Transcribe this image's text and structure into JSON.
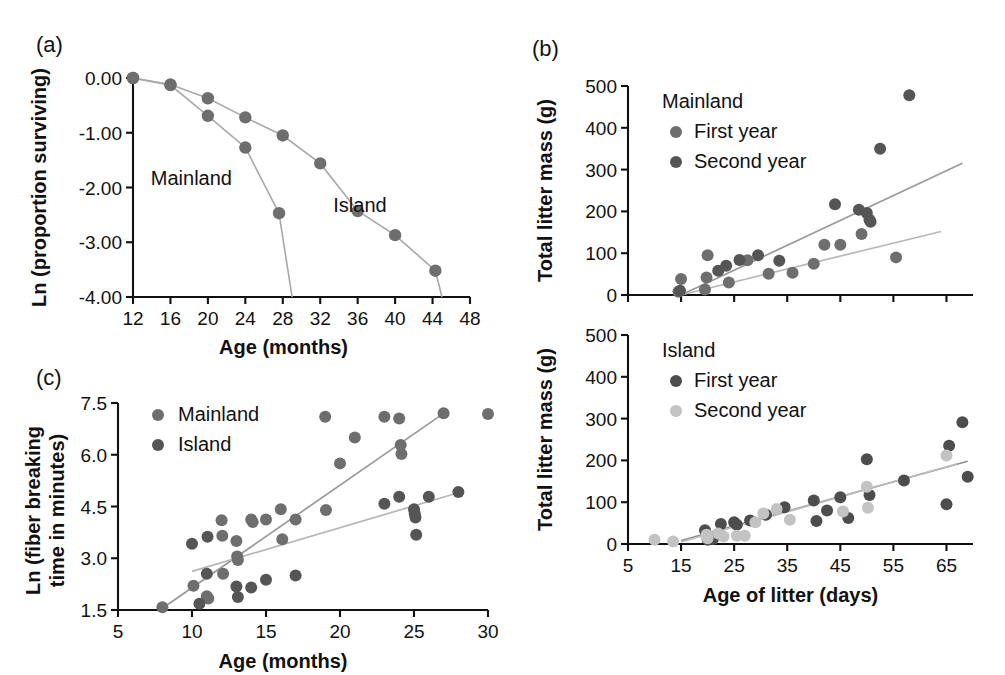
{
  "figure": {
    "background": "#ffffff",
    "ink": "#111111"
  },
  "colors": {
    "dark_gray": "#4d4d4d",
    "mid_gray": "#6e6e6e",
    "light_gray": "#bcbcbc",
    "line_gray": "#9a9a9a",
    "axis": "#111111"
  },
  "panels": {
    "a": {
      "label": "(a)",
      "annotations": [
        {
          "text": "Mainland",
          "x": 13.9,
          "y": -1.95
        },
        {
          "text": "Island",
          "x": 33.4,
          "y": -2.45
        }
      ]
    },
    "b_top": {
      "label": "(b)",
      "legend_title": "Mainland",
      "legend": [
        {
          "label": "First year",
          "color": "#6e6e6e"
        },
        {
          "label": "Second year",
          "color": "#555555"
        }
      ]
    },
    "b_bottom": {
      "legend_title": "Island",
      "legend": [
        {
          "label": "First year",
          "color": "#4d4d4d"
        },
        {
          "label": "Second year",
          "color": "#c3c3c3"
        }
      ]
    },
    "c": {
      "label": "(c)",
      "legend": [
        {
          "label": "Mainland",
          "color": "#6e6e6e"
        },
        {
          "label": "Island",
          "color": "#555555"
        }
      ]
    }
  },
  "chart_data": [
    {
      "id": "panel-a",
      "type": "line",
      "title": "",
      "xlabel": "Age (months)",
      "ylabel": "Ln (proportion surviving)",
      "xlim": [
        12,
        48
      ],
      "ylim": [
        -4.0,
        0.0
      ],
      "xticks": [
        12,
        16,
        20,
        24,
        28,
        32,
        36,
        40,
        44,
        48
      ],
      "yticks": [
        0.0,
        -1.0,
        -2.0,
        -3.0,
        -4.0
      ],
      "ytick_labels": [
        "0.00",
        "-1.00",
        "-2.00",
        "-3.00",
        "-4.00"
      ],
      "grid": false,
      "legend_position": "inline-annotation",
      "series": [
        {
          "name": "Mainland",
          "color": "#6e6e6e",
          "x": [
            12,
            16,
            20,
            24,
            27.6,
            29
          ],
          "y": [
            0.0,
            -0.13,
            -0.69,
            -1.27,
            -2.47,
            -4.0
          ]
        },
        {
          "name": "Island",
          "color": "#6e6e6e",
          "x": [
            12,
            16,
            20,
            24,
            28,
            32,
            36,
            40,
            44.3,
            45
          ],
          "y": [
            0.0,
            -0.12,
            -0.37,
            -0.72,
            -1.05,
            -1.56,
            -2.43,
            -2.87,
            -3.52,
            -4.0
          ]
        }
      ]
    },
    {
      "id": "panel-b-top",
      "type": "scatter",
      "title": "Mainland",
      "xlabel": "",
      "ylabel": "Total litter mass (g)",
      "xlim": [
        5,
        70
      ],
      "ylim": [
        0,
        500
      ],
      "xticks": [
        5,
        15,
        25,
        35,
        45,
        55,
        65
      ],
      "yticks": [
        0,
        100,
        200,
        300,
        400,
        500
      ],
      "grid": false,
      "legend_position": "upper-left-inside",
      "series": [
        {
          "name": "First year",
          "color": "#6e6e6e",
          "points": [
            [
              14.5,
              8
            ],
            [
              15.0,
              38
            ],
            [
              19.5,
              13
            ],
            [
              19.8,
              42
            ],
            [
              20.0,
              95
            ],
            [
              24.0,
              30
            ],
            [
              27.5,
              83
            ],
            [
              31.5,
              51
            ],
            [
              36.0,
              53
            ],
            [
              40.0,
              75
            ],
            [
              45.0,
              120
            ],
            [
              49.0,
              146
            ],
            [
              55.5,
              90
            ],
            [
              42.0,
              120
            ]
          ]
        },
        {
          "name": "Second year",
          "color": "#555555",
          "points": [
            [
              14.8,
              10
            ],
            [
              22.0,
              58
            ],
            [
              23.5,
              70
            ],
            [
              26.0,
              84
            ],
            [
              29.5,
              95
            ],
            [
              33.5,
              82
            ],
            [
              44.0,
              217
            ],
            [
              48.5,
              204
            ],
            [
              50.0,
              196
            ],
            [
              50.5,
              180
            ],
            [
              50.7,
              175
            ],
            [
              52.5,
              350
            ],
            [
              58.0,
              478
            ]
          ]
        }
      ],
      "trendlines": [
        {
          "name": "Second year fit",
          "color": "#9a9a9a",
          "x": [
            15.0,
            68.0
          ],
          "y": [
            0,
            315
          ]
        },
        {
          "name": "First year fit",
          "color": "#b8b8b8",
          "x": [
            15.0,
            64.0
          ],
          "y": [
            0,
            152
          ]
        }
      ]
    },
    {
      "id": "panel-b-bottom",
      "type": "scatter",
      "title": "Island",
      "xlabel": "Age of litter (days)",
      "ylabel": "Total litter mass (g)",
      "xlim": [
        5,
        70
      ],
      "ylim": [
        0,
        500
      ],
      "xticks": [
        5,
        15,
        25,
        35,
        45,
        55,
        65
      ],
      "yticks": [
        0,
        100,
        200,
        300,
        400,
        500
      ],
      "grid": false,
      "legend_position": "upper-left-inside",
      "series": [
        {
          "name": "First year",
          "color": "#4d4d4d",
          "points": [
            [
              19.5,
              33
            ],
            [
              20.0,
              10
            ],
            [
              21.0,
              12
            ],
            [
              22.5,
              48
            ],
            [
              25.0,
              52
            ],
            [
              25.5,
              46
            ],
            [
              28.0,
              56
            ],
            [
              31.0,
              70
            ],
            [
              34.5,
              88
            ],
            [
              40.0,
              104
            ],
            [
              40.5,
              55
            ],
            [
              42.5,
              80
            ],
            [
              45.0,
              112
            ],
            [
              46.5,
              62
            ],
            [
              50.0,
              203
            ],
            [
              50.5,
              117
            ],
            [
              57.0,
              152
            ],
            [
              65.0,
              95
            ],
            [
              65.5,
              235
            ],
            [
              68.0,
              291
            ],
            [
              69.0,
              161
            ]
          ]
        },
        {
          "name": "Second year",
          "color": "#c3c3c3",
          "points": [
            [
              10.0,
              10
            ],
            [
              13.5,
              6
            ],
            [
              19.8,
              22
            ],
            [
              20.0,
              14
            ],
            [
              22.0,
              25
            ],
            [
              23.0,
              18
            ],
            [
              25.5,
              20
            ],
            [
              27.0,
              20
            ],
            [
              29.0,
              52
            ],
            [
              30.5,
              73
            ],
            [
              33.0,
              84
            ],
            [
              35.5,
              58
            ],
            [
              45.5,
              78
            ],
            [
              50.0,
              137
            ],
            [
              50.2,
              87
            ],
            [
              65.0,
              212
            ]
          ]
        }
      ],
      "trendlines": [
        {
          "name": "First year fit",
          "color": "#8d8d8d",
          "x": [
            15.0,
            69.0
          ],
          "y": [
            8,
            198
          ]
        },
        {
          "name": "Second year fit",
          "color": "#bdbdbd",
          "x": [
            15.0,
            67.0
          ],
          "y": [
            5,
            192
          ]
        }
      ]
    },
    {
      "id": "panel-c",
      "type": "scatter",
      "title": "",
      "xlabel": "Age (months)",
      "ylabel": "Ln (fiber breaking time in minutes)",
      "xlim": [
        5,
        30
      ],
      "ylim": [
        1.5,
        7.5
      ],
      "xticks": [
        5,
        10,
        15,
        20,
        25,
        30
      ],
      "yticks": [
        1.5,
        3.0,
        4.5,
        6.0,
        7.5
      ],
      "ytick_labels": [
        "1.5",
        "3.0",
        "4.5",
        "6.0",
        "7.5"
      ],
      "grid": false,
      "legend_position": "upper-left-inside",
      "series": [
        {
          "name": "Mainland",
          "color": "#6e6e6e",
          "points": [
            [
              8.0,
              1.58
            ],
            [
              10.1,
              2.2
            ],
            [
              11.0,
              1.9
            ],
            [
              11.1,
              1.83
            ],
            [
              12.0,
              4.1
            ],
            [
              12.05,
              3.65
            ],
            [
              12.1,
              2.55
            ],
            [
              13.0,
              3.5
            ],
            [
              13.05,
              3.05
            ],
            [
              13.1,
              2.95
            ],
            [
              14.0,
              4.12
            ],
            [
              14.1,
              4.05
            ],
            [
              15.0,
              4.12
            ],
            [
              16.0,
              4.42
            ],
            [
              16.1,
              3.55
            ],
            [
              17.0,
              4.12
            ],
            [
              19.0,
              7.1
            ],
            [
              20.0,
              5.75
            ],
            [
              21.0,
              6.5
            ],
            [
              23.0,
              7.1
            ],
            [
              24.0,
              7.05
            ],
            [
              24.1,
              6.28
            ],
            [
              24.15,
              6.02
            ],
            [
              27.0,
              7.2
            ],
            [
              30.0,
              7.18
            ],
            [
              19.05,
              4.4
            ]
          ]
        },
        {
          "name": "Island",
          "color": "#555555",
          "points": [
            [
              10.0,
              3.42
            ],
            [
              10.5,
              1.68
            ],
            [
              11.0,
              2.55
            ],
            [
              13.0,
              2.18
            ],
            [
              13.1,
              1.88
            ],
            [
              14.0,
              2.15
            ],
            [
              15.0,
              2.38
            ],
            [
              17.0,
              2.5
            ],
            [
              11.05,
              3.62
            ],
            [
              23.0,
              4.58
            ],
            [
              24.0,
              4.78
            ],
            [
              25.0,
              4.42
            ],
            [
              25.05,
              4.3
            ],
            [
              25.1,
              4.18
            ],
            [
              25.15,
              3.68
            ],
            [
              26.0,
              4.78
            ],
            [
              28.0,
              4.92
            ]
          ]
        }
      ],
      "trendlines": [
        {
          "name": "Mainland fit",
          "color": "#9a9a9a",
          "x": [
            8.0,
            27.0
          ],
          "y": [
            1.55,
            7.2
          ]
        },
        {
          "name": "Island fit",
          "color": "#b6b6b6",
          "x": [
            10.0,
            28.0
          ],
          "y": [
            2.62,
            4.9
          ]
        }
      ]
    }
  ]
}
